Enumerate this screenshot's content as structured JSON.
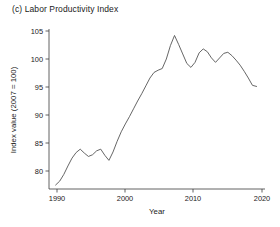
{
  "figure": {
    "panel_label": "(c)",
    "title": "(c) Labor Productivity Index",
    "background_color": "#ffffff",
    "line_color": "#555555",
    "axis_color": "#3b3b3b"
  },
  "axes": {
    "x_title": "Year",
    "y_title": "Index value (2007 = 100)",
    "x_ticks": [
      "1990",
      "2000",
      "2010",
      "2020"
    ],
    "y_ticks": [
      "80",
      "85",
      "90",
      "95",
      "100",
      "105"
    ]
  },
  "chart_data": {
    "type": "line",
    "title": "(c) Labor Productivity Index",
    "xlabel": "Year",
    "ylabel": "Index value (2007 = 100)",
    "xlim": [
      1988.8,
      2020.0
    ],
    "ylim": [
      77.0,
      105.8
    ],
    "xticks": [
      1990,
      2000,
      2010,
      2020
    ],
    "yticks": [
      80,
      85,
      90,
      95,
      100,
      105
    ],
    "grid": false,
    "legend": "none",
    "series": [
      {
        "name": "Labor Productivity Index",
        "color": "#555555",
        "x": [
          1989.8,
          1990.4,
          1991.0,
          1991.6,
          1992.2,
          1992.8,
          1993.4,
          1994.0,
          1994.6,
          1995.2,
          1995.8,
          1996.4,
          1997.0,
          1997.6,
          1998.2,
          1998.8,
          1999.4,
          2000.0,
          2000.6,
          2001.2,
          2001.8,
          2002.4,
          2003.0,
          2003.6,
          2004.2,
          2004.8,
          2005.4,
          2006.0,
          2006.6,
          2007.2,
          2007.8,
          2008.4,
          2009.0,
          2009.6,
          2010.2,
          2010.8,
          2011.4,
          2012.0,
          2012.6,
          2013.2,
          2013.8,
          2014.4,
          2015.0,
          2015.6,
          2016.2,
          2016.8,
          2017.4,
          2018.0,
          2018.6,
          2019.2
        ],
        "y": [
          77.5,
          78.2,
          79.4,
          80.9,
          82.3,
          83.3,
          83.9,
          83.2,
          82.6,
          82.9,
          83.6,
          83.9,
          82.8,
          81.9,
          83.4,
          85.3,
          87.0,
          88.4,
          89.7,
          91.1,
          92.5,
          93.8,
          95.2,
          96.6,
          97.6,
          98.0,
          98.3,
          100.0,
          102.4,
          104.2,
          102.6,
          100.9,
          99.2,
          98.5,
          99.4,
          101.1,
          101.8,
          101.3,
          100.2,
          99.4,
          100.2,
          101.0,
          101.2,
          100.6,
          99.8,
          98.9,
          97.8,
          96.6,
          95.3,
          95.1
        ]
      }
    ],
    "annotations": {
      "peak_value": 104.2,
      "peak_year": 2007.2,
      "start_value": 77.5,
      "start_year": 1989.8,
      "end_value": 95.1,
      "end_year": 2019.2
    }
  }
}
